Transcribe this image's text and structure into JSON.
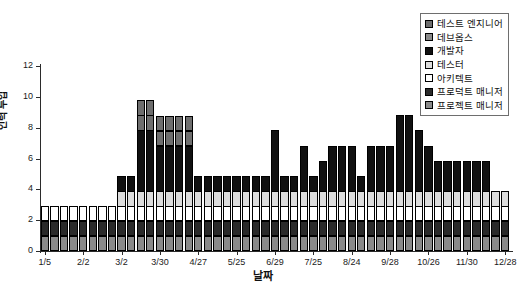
{
  "chart_data": {
    "type": "bar",
    "subtype": "stacked-bar",
    "title": "",
    "xlabel": "날짜",
    "ylabel": "인력 투입",
    "ylim": [
      0,
      12
    ],
    "ytick_values": [
      0,
      2,
      4,
      6,
      8,
      10,
      12
    ],
    "ytick_labels": [
      "0",
      "2",
      "4",
      "6",
      "8",
      "10",
      "12"
    ],
    "grid": false,
    "legend_position": "top-right",
    "xtick_labels": [
      "1/5",
      "2/2",
      "3/2",
      "3/30",
      "4/27",
      "5/25",
      "6/29",
      "7/25",
      "8/24",
      "9/28",
      "10/26",
      "11/30",
      "12/28"
    ],
    "xtick_indices": [
      0,
      4,
      8,
      12,
      16,
      20,
      24,
      28,
      32,
      36,
      40,
      44,
      48
    ],
    "n_bars": 49,
    "series": [
      {
        "name": "프로젝트 매니저",
        "color": "#8a8a8a",
        "values": [
          1,
          1,
          1,
          1,
          1,
          1,
          1,
          1,
          1,
          1,
          1,
          1,
          1,
          1,
          1,
          1,
          1,
          1,
          1,
          1,
          1,
          1,
          1,
          1,
          1,
          1,
          1,
          1,
          1,
          1,
          1,
          1,
          1,
          1,
          1,
          1,
          1,
          1,
          1,
          1,
          1,
          1,
          1,
          1,
          1,
          1,
          1,
          1,
          1
        ]
      },
      {
        "name": "프로덕트 매니저",
        "color": "#2a2a2a",
        "values": [
          1,
          1,
          1,
          1,
          1,
          1,
          1,
          1,
          1,
          1,
          1,
          1,
          1,
          1,
          1,
          1,
          1,
          1,
          1,
          1,
          1,
          1,
          1,
          1,
          1,
          1,
          1,
          1,
          1,
          1,
          1,
          1,
          1,
          1,
          1,
          1,
          1,
          1,
          1,
          1,
          1,
          1,
          1,
          1,
          1,
          1,
          1,
          1,
          1
        ]
      },
      {
        "name": "아키텍트",
        "color": "#ffffff",
        "values": [
          1,
          1,
          1,
          1,
          1,
          1,
          1,
          1,
          1,
          1,
          1,
          1,
          1,
          1,
          1,
          1,
          1,
          1,
          1,
          1,
          1,
          1,
          1,
          1,
          1,
          1,
          1,
          1,
          1,
          1,
          1,
          1,
          1,
          1,
          1,
          1,
          1,
          1,
          1,
          1,
          1,
          1,
          1,
          1,
          1,
          1,
          1,
          1,
          1
        ]
      },
      {
        "name": "테스터",
        "color": "#dcdcdc",
        "values": [
          0,
          0,
          0,
          0,
          0,
          0,
          0,
          0,
          1,
          1,
          1,
          1,
          1,
          1,
          1,
          1,
          1,
          1,
          1,
          1,
          1,
          1,
          1,
          1,
          1,
          1,
          1,
          1,
          1,
          1,
          1,
          1,
          1,
          1,
          1,
          1,
          1,
          1,
          1,
          1,
          1,
          1,
          1,
          1,
          1,
          1,
          1,
          1,
          1
        ]
      },
      {
        "name": "개발자",
        "color": "#111111",
        "values": [
          0,
          0,
          0,
          0,
          0,
          0,
          0,
          0,
          1,
          1,
          4,
          4,
          3,
          3,
          3,
          3,
          1,
          1,
          1,
          1,
          1,
          1,
          1,
          1,
          4,
          1,
          1,
          3,
          1,
          2,
          3,
          3,
          3,
          1,
          3,
          3,
          3,
          5,
          5,
          4,
          3,
          2,
          2,
          2,
          2,
          2,
          2,
          0,
          0
        ]
      },
      {
        "name": "데브옵스",
        "color": "#6e6e6e",
        "values": [
          0,
          0,
          0,
          0,
          0,
          0,
          0,
          0,
          0,
          0,
          1,
          1,
          1,
          1,
          1,
          1,
          0,
          0,
          0,
          0,
          0,
          0,
          0,
          0,
          0,
          0,
          0,
          0,
          0,
          0,
          0,
          0,
          0,
          0,
          0,
          0,
          0,
          0,
          0,
          0,
          0,
          0,
          0,
          0,
          0,
          0,
          0,
          0,
          0
        ]
      },
      {
        "name": "테스트 엔지니어",
        "color": "#6e6e6e",
        "values": [
          0,
          0,
          0,
          0,
          0,
          0,
          0,
          0,
          0,
          0,
          1,
          1,
          1,
          1,
          1,
          1,
          0,
          0,
          0,
          0,
          0,
          0,
          0,
          0,
          0,
          0,
          0,
          0,
          0,
          0,
          0,
          0,
          0,
          0,
          0,
          0,
          0,
          0,
          0,
          0,
          0,
          0,
          0,
          0,
          0,
          0,
          0,
          0,
          0
        ]
      }
    ],
    "totals": [
      3,
      3,
      3,
      3,
      3,
      5,
      5,
      5,
      6,
      6,
      9,
      9,
      8,
      8,
      8,
      8,
      7,
      7,
      7,
      5,
      5,
      5,
      5,
      5,
      8,
      5,
      5,
      7,
      5,
      6,
      7,
      7,
      7,
      5,
      7,
      7,
      7,
      10,
      10,
      9,
      8,
      7,
      7,
      7,
      7,
      5,
      5,
      4,
      5
    ]
  },
  "legend": {
    "items": [
      {
        "label": "테스트 엔지니어",
        "swatch": "#6e6e6e"
      },
      {
        "label": "데브옵스",
        "swatch": "#8a8a8a"
      },
      {
        "label": "개발자",
        "swatch": "#111111"
      },
      {
        "label": "테스터",
        "swatch": "#dcdcdc"
      },
      {
        "label": "아키텍트",
        "swatch": "#ffffff"
      },
      {
        "label": "프로덕트 매니저",
        "swatch": "#2a2a2a"
      },
      {
        "label": "프로젝트 매니저",
        "swatch": "#8a8a8a"
      }
    ]
  }
}
